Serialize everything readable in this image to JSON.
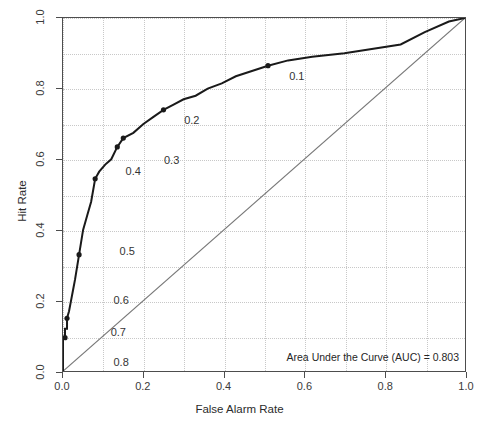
{
  "title_fragment": "",
  "axis_titles": {
    "x": "False Alarm Rate",
    "y": "Hit Rate"
  },
  "annotation": {
    "auc_text": "Area Under the Curve (AUC) = 0.803"
  },
  "ticks": {
    "x": [
      "0.0",
      "0.2",
      "0.4",
      "0.6",
      "0.8",
      "1.0"
    ],
    "y": [
      "0.0",
      "0.2",
      "0.4",
      "0.6",
      "0.8",
      "1.0"
    ]
  },
  "colors": {
    "curve": "#1a1a1a",
    "diagonal": "#777777",
    "grid": "#c8c8c8",
    "frame": "#4d4d4d",
    "text": "#2b2b2b"
  },
  "chart_data": {
    "type": "line",
    "title": "",
    "xlabel": "False Alarm Rate",
    "ylabel": "Hit Rate",
    "xlim": [
      0.0,
      1.0
    ],
    "ylim": [
      0.0,
      1.0
    ],
    "grid": true,
    "legend": "none",
    "auc": 0.803,
    "series": [
      {
        "name": "ROC curve",
        "style": "step",
        "x": [
          0.0,
          0.0,
          0.0,
          0.0,
          0.005,
          0.005,
          0.01,
          0.01,
          0.01,
          0.015,
          0.015,
          0.02,
          0.02,
          0.025,
          0.025,
          0.03,
          0.03,
          0.04,
          0.04,
          0.05,
          0.05,
          0.06,
          0.06,
          0.07,
          0.07,
          0.08,
          0.08,
          0.09,
          0.09,
          0.105,
          0.105,
          0.12,
          0.12,
          0.135,
          0.135,
          0.15,
          0.15,
          0.175,
          0.175,
          0.2,
          0.2,
          0.225,
          0.225,
          0.25,
          0.25,
          0.275,
          0.275,
          0.3,
          0.3,
          0.33,
          0.33,
          0.36,
          0.36,
          0.395,
          0.395,
          0.43,
          0.43,
          0.47,
          0.47,
          0.51,
          0.51,
          0.56,
          0.56,
          0.62,
          0.62,
          0.7,
          0.7,
          0.84,
          0.84,
          0.9,
          0.9,
          0.96,
          0.96,
          1.0
        ],
        "y": [
          0.0,
          0.02,
          0.02,
          0.095,
          0.095,
          0.12,
          0.12,
          0.15,
          0.15,
          0.17,
          0.17,
          0.2,
          0.2,
          0.23,
          0.23,
          0.26,
          0.26,
          0.33,
          0.33,
          0.4,
          0.4,
          0.44,
          0.44,
          0.48,
          0.48,
          0.545,
          0.545,
          0.565,
          0.565,
          0.585,
          0.585,
          0.6,
          0.6,
          0.635,
          0.635,
          0.66,
          0.66,
          0.675,
          0.675,
          0.7,
          0.7,
          0.72,
          0.72,
          0.74,
          0.74,
          0.755,
          0.755,
          0.77,
          0.77,
          0.78,
          0.78,
          0.8,
          0.8,
          0.815,
          0.815,
          0.835,
          0.835,
          0.85,
          0.85,
          0.865,
          0.865,
          0.88,
          0.88,
          0.89,
          0.89,
          0.9,
          0.9,
          0.925,
          0.925,
          0.96,
          0.96,
          0.99,
          0.99,
          1.0
        ]
      },
      {
        "name": "Chance diagonal",
        "style": "line",
        "x": [
          0.0,
          1.0
        ],
        "y": [
          0.0,
          1.0
        ]
      }
    ],
    "threshold_points": [
      {
        "label": "0.1",
        "x": 0.51,
        "y": 0.865,
        "label_x": 0.56,
        "label_y": 0.838
      },
      {
        "label": "0.2",
        "x": 0.25,
        "y": 0.74,
        "label_x": 0.3,
        "label_y": 0.712
      },
      {
        "label": "0.3",
        "x": 0.15,
        "y": 0.66,
        "label_x": 0.25,
        "label_y": 0.6
      },
      {
        "label": "0.4",
        "x": 0.135,
        "y": 0.635,
        "label_x": 0.155,
        "label_y": 0.57
      },
      {
        "label": "0.5",
        "x": 0.08,
        "y": 0.545,
        "label_x": 0.14,
        "label_y": 0.345
      },
      {
        "label": "0.6",
        "x": 0.04,
        "y": 0.33,
        "label_x": 0.125,
        "label_y": 0.205
      },
      {
        "label": "0.7",
        "x": 0.01,
        "y": 0.15,
        "label_x": 0.118,
        "label_y": 0.115
      },
      {
        "label": "0.8",
        "x": 0.005,
        "y": 0.095,
        "label_x": 0.125,
        "label_y": 0.03
      }
    ]
  }
}
